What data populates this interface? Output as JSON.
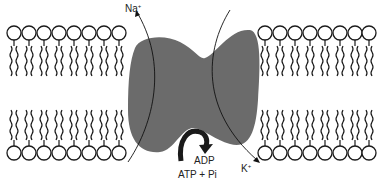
{
  "diagram": {
    "labels": {
      "sodium": {
        "ion": "Na",
        "charge": "+"
      },
      "potassium": {
        "ion": "K",
        "charge": "+"
      },
      "adp": "ADP",
      "atp": "ATP + Pi"
    },
    "bilayer": {
      "left_lipid_count": 8,
      "right_lipid_count": 8,
      "leaflets": [
        "top",
        "bottom"
      ]
    },
    "colors": {
      "protein": "#6b6b6b",
      "stroke": "#1a1a1a",
      "arrow_curved": "#1a1a1a",
      "background": "#ffffff"
    }
  }
}
